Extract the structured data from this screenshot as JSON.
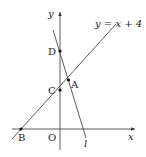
{
  "diagram": {
    "axes": {
      "x_label": "x",
      "y_label": "y",
      "origin_label": "O"
    },
    "lines": [
      {
        "name": "line-y-eq-x-plus-4",
        "label": "y = x + 4"
      },
      {
        "name": "line-l",
        "label": "l"
      }
    ],
    "points": {
      "A": "A",
      "B": "B",
      "C": "C",
      "D": "D"
    },
    "colors": {
      "stroke": "#333333",
      "text": "#222222",
      "background": "#ffffff"
    }
  }
}
